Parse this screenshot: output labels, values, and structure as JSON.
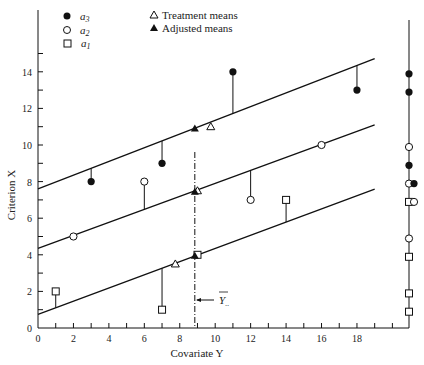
{
  "chart_data": {
    "type": "scatter",
    "title": "",
    "xlabel": "Covariate Y",
    "ylabel": "Criterion X",
    "xlim": [
      0,
      20
    ],
    "ylim": [
      0,
      15
    ],
    "x_ticks": [
      0,
      2,
      4,
      6,
      8,
      10,
      12,
      14,
      16,
      18
    ],
    "y_ticks": [
      0,
      2,
      4,
      6,
      8,
      10,
      12,
      14
    ],
    "grid": false,
    "legend_position": "top-left",
    "legend": [
      {
        "marker": "filled-circle",
        "label": "a3"
      },
      {
        "marker": "open-circle",
        "label": "a2"
      },
      {
        "marker": "open-square",
        "label": "a1"
      },
      {
        "marker": "open-triangle",
        "label": "Treatment means"
      },
      {
        "marker": "filled-triangle",
        "label": "Adjusted means"
      }
    ],
    "grand_mean_covariate": {
      "label": "Y..",
      "x": 8.85
    },
    "series": [
      {
        "name": "a3",
        "marker": "filled-circle",
        "points": [
          [
            3,
            8
          ],
          [
            7,
            9
          ],
          [
            11,
            14
          ],
          [
            18,
            13
          ]
        ],
        "regression_line": {
          "intercept": 7.6,
          "slope": 0.375
        },
        "treatment_mean": [
          9.75,
          11
        ],
        "adjusted_mean": [
          8.85,
          10.9
        ]
      },
      {
        "name": "a2",
        "marker": "open-circle",
        "points": [
          [
            2,
            5
          ],
          [
            6,
            8
          ],
          [
            12,
            7
          ],
          [
            16,
            10
          ]
        ],
        "regression_line": {
          "intercept": 4.35,
          "slope": 0.355
        },
        "treatment_mean": [
          9,
          7.5
        ],
        "adjusted_mean": [
          8.85,
          7.45
        ]
      },
      {
        "name": "a1",
        "marker": "open-square",
        "points": [
          [
            1,
            2
          ],
          [
            7,
            1
          ],
          [
            9,
            4
          ],
          [
            14,
            7
          ]
        ],
        "regression_line": {
          "intercept": 0.75,
          "slope": 0.36
        },
        "treatment_mean": [
          7.75,
          3.5
        ],
        "adjusted_mean": [
          8.85,
          3.95
        ]
      }
    ],
    "marginal_distribution": {
      "position": "right",
      "points": [
        {
          "y": 14,
          "marker": "filled-circle"
        },
        {
          "y": 13,
          "marker": "filled-circle"
        },
        {
          "y": 10,
          "marker": "open-circle"
        },
        {
          "y": 9,
          "marker": "filled-circle"
        },
        {
          "y": 8,
          "marker": "open-circle"
        },
        {
          "y": 8,
          "marker": "filled-circle"
        },
        {
          "y": 7,
          "marker": "open-square"
        },
        {
          "y": 7,
          "marker": "open-circle"
        },
        {
          "y": 5,
          "marker": "open-circle"
        },
        {
          "y": 4,
          "marker": "open-square"
        },
        {
          "y": 2,
          "marker": "open-square"
        },
        {
          "y": 1,
          "marker": "open-square"
        }
      ]
    }
  },
  "labels": {
    "xlabel": "Covariate Y",
    "ylabel": "Criterion X",
    "legend_a3": "a",
    "legend_a3_sub": "3",
    "legend_a2": "a",
    "legend_a2_sub": "2",
    "legend_a1": "a",
    "legend_a1_sub": "1",
    "legend_treat": "Treatment means",
    "legend_adj": "Adjusted means",
    "grand_mean_label": "Y",
    "grand_mean_sub": ".."
  }
}
